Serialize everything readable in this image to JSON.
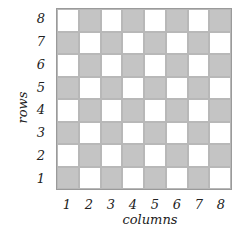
{
  "diagram": {
    "type": "checkerboard",
    "rows": 8,
    "cols": 8,
    "colors": {
      "light": "#ffffff",
      "dark": "#c4c4c4",
      "border": "#9a9a9a"
    },
    "row_labels": [
      "8",
      "7",
      "6",
      "5",
      "4",
      "3",
      "2",
      "1"
    ],
    "col_labels": [
      "1",
      "2",
      "3",
      "4",
      "5",
      "6",
      "7",
      "8"
    ],
    "x_title": "columns",
    "y_title": "rows",
    "pattern_note": "row 1 col 1 is dark; alternating"
  }
}
